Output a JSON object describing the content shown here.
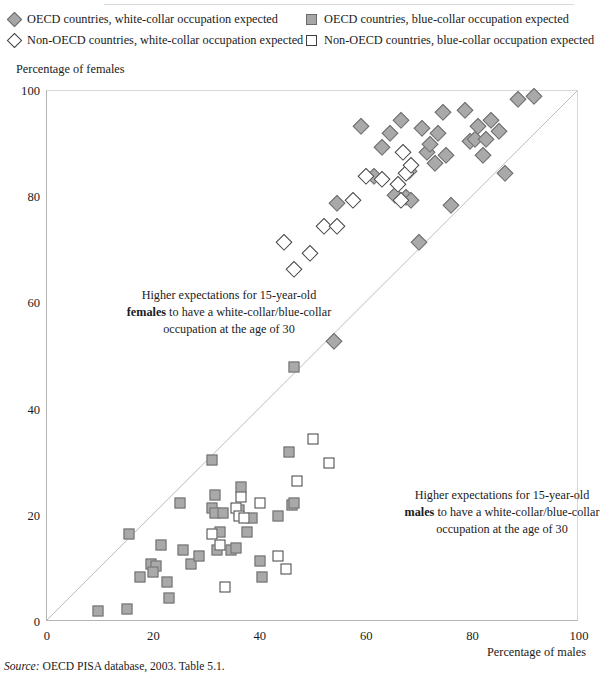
{
  "legend": {
    "items": [
      {
        "marker": "diamond-filled",
        "label": "OECD countries, white-collar occupation expected",
        "pos": "r1c1"
      },
      {
        "marker": "diamond-open",
        "label": "Non-OECD countries, white-collar occupation expected",
        "pos": "r2c1"
      },
      {
        "marker": "square-filled",
        "label": "OECD countries, blue-collar occupation expected",
        "pos": "r1c2"
      },
      {
        "marker": "square-open",
        "label": "Non-OECD countries, blue-collar occupation expected",
        "pos": "r2c2"
      }
    ]
  },
  "axes": {
    "ylabel": "Percentage of females",
    "xlabel": "Percentage of males",
    "yticks": [
      "0",
      "20",
      "40",
      "60",
      "80",
      "100"
    ],
    "xticks": [
      "0",
      "20",
      "40",
      "60",
      "80",
      "100"
    ]
  },
  "annotations": {
    "females_line1": "Higher expectations for 15-year-old",
    "females_bold": "females",
    "females_line2": " to have a white-collar/blue-collar",
    "females_line3": "occupation at the age of 30",
    "males_line1": "Higher expectations for 15-year-old",
    "males_bold": "males",
    "males_line2": " to have a white-collar/blue-collar",
    "males_line3": "occupation at the age of 30"
  },
  "source": {
    "prefix": "Source:",
    "text": " OECD PISA database, 2003. Table 5.1."
  },
  "colors": {
    "marker_fill": "#a9a9a9",
    "marker_stroke": "#6e6e6e",
    "open_stroke": "#404040",
    "axis": "#b4b4b4",
    "diagonal": "#bdbdbd"
  },
  "chart_data": {
    "type": "scatter",
    "title": "",
    "xlabel": "Percentage of males",
    "ylabel": "Percentage of females",
    "xlim": [
      0,
      100
    ],
    "ylim": [
      0,
      100
    ],
    "grid": false,
    "legend_position": "top",
    "reference_line": {
      "type": "identity",
      "from": [
        0,
        0
      ],
      "to": [
        100,
        100
      ]
    },
    "series": [
      {
        "name": "OECD countries, white-collar occupation expected",
        "marker": "diamond-filled",
        "points": [
          [
            54.5,
            79.0
          ],
          [
            59.0,
            93.5
          ],
          [
            61.5,
            84.0
          ],
          [
            63.0,
            89.5
          ],
          [
            64.5,
            92.0
          ],
          [
            65.5,
            80.5
          ],
          [
            66.5,
            94.5
          ],
          [
            67.5,
            80.0
          ],
          [
            68.5,
            79.5
          ],
          [
            68.0,
            85.0
          ],
          [
            70.5,
            93.0
          ],
          [
            71.5,
            88.5
          ],
          [
            72.0,
            90.0
          ],
          [
            73.0,
            86.5
          ],
          [
            73.5,
            92.0
          ],
          [
            74.5,
            96.0
          ],
          [
            75.0,
            88.0
          ],
          [
            76.0,
            78.5
          ],
          [
            70.0,
            71.5
          ],
          [
            78.5,
            96.5
          ],
          [
            79.5,
            90.5
          ],
          [
            80.5,
            91.0
          ],
          [
            81.0,
            93.5
          ],
          [
            82.0,
            88.0
          ],
          [
            82.5,
            91.0
          ],
          [
            83.5,
            94.5
          ],
          [
            85.0,
            92.5
          ],
          [
            86.0,
            84.5
          ],
          [
            88.5,
            98.5
          ],
          [
            91.5,
            99.0
          ],
          [
            54.0,
            53.0
          ]
        ]
      },
      {
        "name": "Non-OECD countries, white-collar occupation expected",
        "marker": "diamond-open",
        "points": [
          [
            44.5,
            71.5
          ],
          [
            46.5,
            66.5
          ],
          [
            49.5,
            69.5
          ],
          [
            52.0,
            74.5
          ],
          [
            54.5,
            74.5
          ],
          [
            57.5,
            79.5
          ],
          [
            60.0,
            84.0
          ],
          [
            63.0,
            83.5
          ],
          [
            66.0,
            82.5
          ],
          [
            66.5,
            79.5
          ],
          [
            67.5,
            84.5
          ],
          [
            68.5,
            86.0
          ],
          [
            67.0,
            88.5
          ]
        ]
      },
      {
        "name": "OECD countries, blue-collar occupation expected",
        "marker": "square-filled",
        "points": [
          [
            9.5,
            2.0
          ],
          [
            15.0,
            2.5
          ],
          [
            15.5,
            16.5
          ],
          [
            17.5,
            8.5
          ],
          [
            19.5,
            11.0
          ],
          [
            20.5,
            10.5
          ],
          [
            20.0,
            9.5
          ],
          [
            21.5,
            14.5
          ],
          [
            22.5,
            7.5
          ],
          [
            23.0,
            4.5
          ],
          [
            25.0,
            22.5
          ],
          [
            25.5,
            13.5
          ],
          [
            27.0,
            11.0
          ],
          [
            28.5,
            12.5
          ],
          [
            31.0,
            30.5
          ],
          [
            31.5,
            24.0
          ],
          [
            31.0,
            21.5
          ],
          [
            31.5,
            20.5
          ],
          [
            32.5,
            17.0
          ],
          [
            32.0,
            13.5
          ],
          [
            33.0,
            20.5
          ],
          [
            34.5,
            13.5
          ],
          [
            35.5,
            14.0
          ],
          [
            36.0,
            21.0
          ],
          [
            36.5,
            25.5
          ],
          [
            37.5,
            17.0
          ],
          [
            38.5,
            19.5
          ],
          [
            40.0,
            11.5
          ],
          [
            43.5,
            20.0
          ],
          [
            45.5,
            32.0
          ],
          [
            46.0,
            22.0
          ],
          [
            46.5,
            22.5
          ],
          [
            46.5,
            48.0
          ],
          [
            40.5,
            8.5
          ]
        ]
      },
      {
        "name": "Non-OECD countries, blue-collar occupation expected",
        "marker": "square-open",
        "points": [
          [
            31.0,
            16.5
          ],
          [
            32.5,
            14.5
          ],
          [
            33.5,
            6.5
          ],
          [
            35.5,
            21.5
          ],
          [
            36.0,
            20.0
          ],
          [
            37.0,
            19.5
          ],
          [
            36.5,
            23.5
          ],
          [
            40.0,
            22.5
          ],
          [
            43.5,
            12.5
          ],
          [
            45.0,
            10.0
          ],
          [
            47.0,
            26.5
          ],
          [
            50.0,
            34.5
          ],
          [
            53.0,
            30.0
          ]
        ]
      }
    ]
  }
}
